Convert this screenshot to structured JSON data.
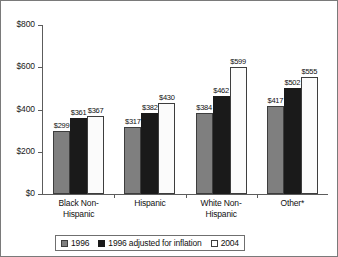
{
  "chart_data": {
    "type": "bar",
    "title": "",
    "subtitle": "",
    "xlabel": "",
    "ylabel": "",
    "ylim": [
      0,
      800
    ],
    "ytick_values": [
      0,
      200,
      400,
      600,
      800
    ],
    "ytick_labels": [
      "$0",
      "$200",
      "$400",
      "$600",
      "$800"
    ],
    "grid": false,
    "legend_position": "bottom",
    "value_prefix": "$",
    "categories": [
      "Black Non-Hispanic",
      "Hispanic",
      "White Non-Hispanic",
      "Other*"
    ],
    "category_lines": [
      [
        "Black Non-",
        "Hispanic"
      ],
      [
        "Hispanic"
      ],
      [
        "White Non-",
        "Hispanic"
      ],
      [
        "Other*"
      ]
    ],
    "series": [
      {
        "name": "1996",
        "color": "#7f7f7f",
        "values": [
          299,
          317,
          384,
          417
        ],
        "labels": [
          "$299",
          "$317",
          "$384",
          "$417"
        ]
      },
      {
        "name": "1996 adjusted for inflation",
        "color": "#1a1a1a",
        "values": [
          361,
          382,
          462,
          502
        ],
        "labels": [
          "$361",
          "$382",
          "$462",
          "$502"
        ]
      },
      {
        "name": "2004",
        "color": "#ffffff",
        "values": [
          367,
          430,
          599,
          555
        ],
        "labels": [
          "$367",
          "$430",
          "$599",
          "$555"
        ]
      }
    ]
  },
  "legend": {
    "items": [
      {
        "label": "1996",
        "swatch": "legend-swatch-1996"
      },
      {
        "label": "1996 adjusted for inflation",
        "swatch": "legend-swatch-1996-adjusted"
      },
      {
        "label": "2004",
        "swatch": "legend-swatch-2004"
      }
    ]
  }
}
